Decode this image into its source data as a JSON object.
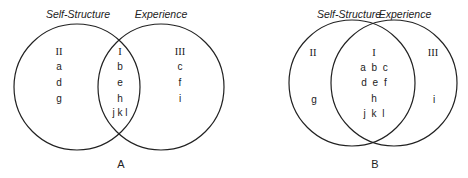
{
  "diagrams": [
    {
      "id": "A",
      "panel_label": "A",
      "left_circle_title": "Self-Structure",
      "right_circle_title": "Experience",
      "regions": {
        "left_only": {
          "numeral": "II",
          "items": [
            "a",
            "d",
            "g"
          ]
        },
        "overlap": {
          "numeral": "I",
          "items": [
            "b",
            "e",
            "h",
            "j k l"
          ]
        },
        "right_only": {
          "numeral": "III",
          "items": [
            "c",
            "f",
            "i"
          ]
        }
      }
    },
    {
      "id": "B",
      "panel_label": "B",
      "left_circle_title": "Self-Structure",
      "right_circle_title": "Experience",
      "regions": {
        "left_only": {
          "numeral": "II",
          "items": [
            "g"
          ]
        },
        "overlap": {
          "numeral": "I",
          "rows": [
            "a b c",
            "d e f",
            "h",
            "j k l"
          ]
        },
        "right_only": {
          "numeral": "III",
          "items": [
            "i"
          ]
        }
      }
    }
  ],
  "colors": {
    "stroke": "#222222",
    "background": "#ffffff"
  }
}
